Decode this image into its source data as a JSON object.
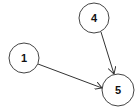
{
  "graph": {
    "nodes": [
      {
        "id": "1",
        "label": "1",
        "cx": 24,
        "cy": 58,
        "r": 15
      },
      {
        "id": "4",
        "label": "4",
        "cx": 94,
        "cy": 18,
        "r": 15
      },
      {
        "id": "5",
        "label": "5",
        "cx": 118,
        "cy": 90,
        "r": 16
      }
    ],
    "edges": [
      {
        "from": "1",
        "to": "5",
        "directed": true
      },
      {
        "from": "4",
        "to": "5",
        "directed": true
      }
    ],
    "colors": {
      "stroke": "#333333",
      "fill": "#ffffff",
      "background": "#ffffff"
    }
  }
}
